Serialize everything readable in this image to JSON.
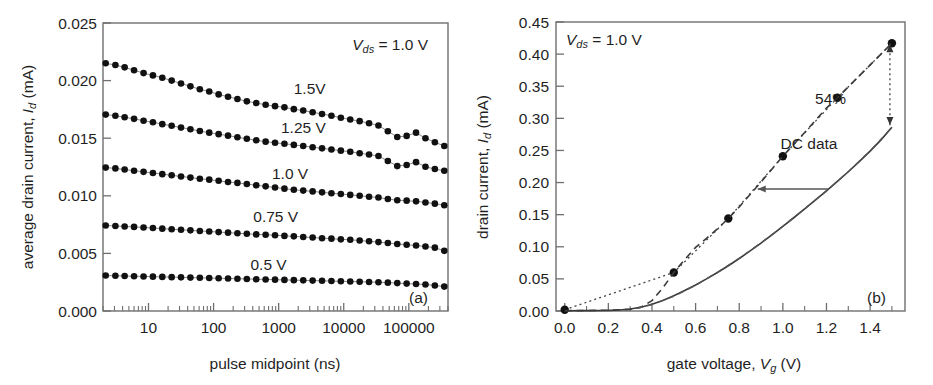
{
  "figure": {
    "panel_a_label": "(a)",
    "panel_b_label": "(b)"
  },
  "chart_data": [
    {
      "panel": "(a)",
      "type": "scatter",
      "title": "",
      "xlabel": "pulse midpoint (ns)",
      "ylabel": "average drain current, I_d (mA)",
      "ylabel_parts": {
        "pre": "average drain current, ",
        "sym": "I",
        "sub": "d",
        "post": " (mA)"
      },
      "xlabel_parts": {
        "text": "pulse midpoint (ns)"
      },
      "xscale": "log",
      "xlim": [
        2,
        400000
      ],
      "ylim": [
        0.0,
        0.025
      ],
      "grid": false,
      "xticks": [
        10,
        100,
        1000,
        10000,
        100000
      ],
      "xticklabels": [
        "10",
        "100",
        "1000",
        "10000",
        "100000"
      ],
      "yticks": [
        0.0,
        0.005,
        0.01,
        0.015,
        0.02,
        0.025
      ],
      "yticklabels": [
        "0.000",
        "0.005",
        "0.010",
        "0.015",
        "0.020",
        "0.025"
      ],
      "annotations": [
        {
          "name": "vds-annotation",
          "pre": "V",
          "sub": "ds",
          "post": " = 1.0 V"
        }
      ],
      "series": [
        {
          "name": "1.5V",
          "label": "1.5V",
          "x": [
            2.2,
            3.1,
            4.3,
            6.0,
            8.4,
            11.7,
            16.3,
            22.7,
            31.6,
            44.1,
            61.5,
            85.8,
            119.6,
            166.8,
            232.6,
            324.4,
            452.4,
            630.9,
            879.9,
            1227,
            1711,
            2386,
            3328,
            4641,
            6473,
            9027,
            12590,
            17560,
            24490,
            34150,
            47630,
            66430,
            92640,
            129200,
            180200,
            251300,
            350500
          ],
          "y": [
            0.0215,
            0.02135,
            0.02115,
            0.0209,
            0.02065,
            0.02045,
            0.02025,
            0.02,
            0.01975,
            0.0195,
            0.01925,
            0.01905,
            0.0188,
            0.0186,
            0.0184,
            0.0182,
            0.01805,
            0.0179,
            0.01778,
            0.01768,
            0.01752,
            0.0174,
            0.01725,
            0.0171,
            0.01695,
            0.01678,
            0.01662,
            0.01648,
            0.0163,
            0.0161,
            0.0156,
            0.0151,
            0.0152,
            0.01548,
            0.015,
            0.01465,
            0.01432
          ]
        },
        {
          "name": "1.25 V",
          "label": "1.25 V",
          "x": [
            2.2,
            3.1,
            4.3,
            6.0,
            8.4,
            11.7,
            16.3,
            22.7,
            31.6,
            44.1,
            61.5,
            85.8,
            119.6,
            166.8,
            232.6,
            324.4,
            452.4,
            630.9,
            879.9,
            1227,
            1711,
            2386,
            3328,
            4641,
            6473,
            9027,
            12590,
            17560,
            24490,
            34150,
            47630,
            66430,
            92640,
            129200,
            180200,
            251300,
            350500
          ],
          "y": [
            0.01705,
            0.01695,
            0.01682,
            0.01668,
            0.01652,
            0.01638,
            0.01622,
            0.01608,
            0.01592,
            0.01578,
            0.01562,
            0.01548,
            0.01535,
            0.01522,
            0.01508,
            0.01495,
            0.01482,
            0.0147,
            0.0146,
            0.01452,
            0.01442,
            0.01432,
            0.01422,
            0.01412,
            0.01402,
            0.01392,
            0.01382,
            0.0137,
            0.01358,
            0.01345,
            0.01302,
            0.01258,
            0.01268,
            0.01292,
            0.01252,
            0.01232,
            0.01218
          ]
        },
        {
          "name": "1.0 V",
          "label": "1.0 V",
          "x": [
            2.2,
            3.1,
            4.3,
            6.0,
            8.4,
            11.7,
            16.3,
            22.7,
            31.6,
            44.1,
            61.5,
            85.8,
            119.6,
            166.8,
            232.6,
            324.4,
            452.4,
            630.9,
            879.9,
            1227,
            1711,
            2386,
            3328,
            4641,
            6473,
            9027,
            12590,
            17560,
            24490,
            34150,
            47630,
            66430,
            92640,
            129200,
            180200,
            251300,
            350500
          ],
          "y": [
            0.01245,
            0.01238,
            0.01228,
            0.01218,
            0.01208,
            0.01198,
            0.01188,
            0.01178,
            0.01168,
            0.01158,
            0.01148,
            0.0114,
            0.0113,
            0.0112,
            0.01112,
            0.01102,
            0.01092,
            0.01082,
            0.01072,
            0.01062,
            0.01052,
            0.01045,
            0.01038,
            0.0103,
            0.01022,
            0.01015,
            0.01008,
            0.01,
            0.00992,
            0.00985,
            0.00972,
            0.00962,
            0.00958,
            0.00952,
            0.00942,
            0.00932,
            0.00918
          ]
        },
        {
          "name": "0.75 V",
          "label": "0.75 V",
          "x": [
            2.2,
            3.1,
            4.3,
            6.0,
            8.4,
            11.7,
            16.3,
            22.7,
            31.6,
            44.1,
            61.5,
            85.8,
            119.6,
            166.8,
            232.6,
            324.4,
            452.4,
            630.9,
            879.9,
            1227,
            1711,
            2386,
            3328,
            4641,
            6473,
            9027,
            12590,
            17560,
            24490,
            34150,
            47630,
            66430,
            92640,
            129200,
            180200,
            251300,
            350500
          ],
          "y": [
            0.00742,
            0.00738,
            0.00734,
            0.0073,
            0.00725,
            0.0072,
            0.00715,
            0.0071,
            0.00705,
            0.007,
            0.00695,
            0.0069,
            0.00685,
            0.0068,
            0.00675,
            0.0067,
            0.00665,
            0.00662,
            0.00658,
            0.00652,
            0.00648,
            0.00642,
            0.00638,
            0.00632,
            0.00628,
            0.00622,
            0.00618,
            0.00612,
            0.00605,
            0.00598,
            0.0059,
            0.00582,
            0.00575,
            0.00568,
            0.0056,
            0.0055,
            0.00522
          ]
        },
        {
          "name": "0.5 V",
          "label": "0.5 V",
          "x": [
            2.2,
            3.1,
            4.3,
            6.0,
            8.4,
            11.7,
            16.3,
            22.7,
            31.6,
            44.1,
            61.5,
            85.8,
            119.6,
            166.8,
            232.6,
            324.4,
            452.4,
            630.9,
            879.9,
            1227,
            1711,
            2386,
            3328,
            4641,
            6473,
            9027,
            12590,
            17560,
            24490,
            34150,
            47630,
            66430,
            92640,
            129200,
            180200,
            251300,
            350500
          ],
          "y": [
            0.00308,
            0.00306,
            0.00304,
            0.00302,
            0.003,
            0.00298,
            0.00296,
            0.00294,
            0.00292,
            0.0029,
            0.00288,
            0.00286,
            0.00284,
            0.00282,
            0.0028,
            0.00278,
            0.00276,
            0.00274,
            0.00272,
            0.0027,
            0.00268,
            0.00266,
            0.00264,
            0.00262,
            0.0026,
            0.00258,
            0.00256,
            0.00254,
            0.00252,
            0.0025,
            0.00246,
            0.00242,
            0.00238,
            0.00234,
            0.0023,
            0.00222,
            0.00212
          ]
        }
      ],
      "series_label_positions": [
        {
          "label": "1.5V",
          "x": 3000,
          "y": 0.0188
        },
        {
          "label": "1.25 V",
          "x": 2400,
          "y": 0.01545
        },
        {
          "label": "1.0 V",
          "x": 1500,
          "y": 0.01145
        },
        {
          "label": "0.75 V",
          "x": 900,
          "y": 0.00775
        },
        {
          "label": "0.5 V",
          "x": 700,
          "y": 0.0036
        }
      ]
    },
    {
      "panel": "(b)",
      "type": "line",
      "title": "",
      "xlabel": "gate voltage, V_g (V)",
      "ylabel": "drain current, I_d (mA)",
      "ylabel_parts": {
        "pre": "drain current, ",
        "sym": "I",
        "sub": "d",
        "post": " (mA)"
      },
      "xlabel_parts": {
        "pre": "gate voltage, ",
        "sym": "V",
        "sub": "g",
        "post": " (V)"
      },
      "xscale": "linear",
      "xlim": [
        -0.04,
        1.56
      ],
      "ylim": [
        0.0,
        0.45
      ],
      "grid": false,
      "xticks": [
        0.0,
        0.2,
        0.4,
        0.6,
        0.8,
        1.0,
        1.2,
        1.4
      ],
      "xticklabels": [
        "0.0",
        "0.2",
        "0.4",
        "0.6",
        "0.8",
        "1.0",
        "1.2",
        "1.4"
      ],
      "yticks": [
        0.0,
        0.05,
        0.1,
        0.15,
        0.2,
        0.25,
        0.3,
        0.35,
        0.4,
        0.45
      ],
      "yticklabels": [
        "0.00",
        "0.05",
        "0.10",
        "0.15",
        "0.20",
        "0.25",
        "0.30",
        "0.35",
        "0.40",
        "0.45"
      ],
      "annotations": [
        {
          "name": "vds-annotation",
          "pre": "V",
          "sub": "ds",
          "post": " = 1.0 V"
        },
        {
          "name": "percent-annotation",
          "text": "54%",
          "x": 1.29,
          "y": 0.322
        },
        {
          "name": "dc-data-annotation",
          "text": "DC data",
          "x": 1.12,
          "y": 0.253
        }
      ],
      "series": [
        {
          "name": "pulsed data points",
          "style": "markers-dotted",
          "x": [
            0.0,
            0.5,
            0.75,
            1.0,
            1.25,
            1.5
          ],
          "y": [
            0.002,
            0.06,
            0.144,
            0.241,
            0.332,
            0.417
          ]
        },
        {
          "name": "pulsed dashed fit",
          "style": "dashed",
          "x": [
            0.0,
            0.1,
            0.2,
            0.3,
            0.35,
            0.4,
            0.45,
            0.5,
            0.55,
            0.6,
            0.65,
            0.7,
            0.75,
            0.8,
            0.9,
            1.0,
            1.1,
            1.2,
            1.25,
            1.35,
            1.45,
            1.5
          ],
          "y": [
            0.0005,
            0.0008,
            0.0012,
            0.0025,
            0.006,
            0.016,
            0.036,
            0.06,
            0.08,
            0.099,
            0.113,
            0.128,
            0.144,
            0.162,
            0.201,
            0.241,
            0.278,
            0.316,
            0.332,
            0.366,
            0.4,
            0.417
          ]
        },
        {
          "name": "DC data solid",
          "style": "solid",
          "x": [
            0.0,
            0.1,
            0.2,
            0.25,
            0.3,
            0.35,
            0.4,
            0.45,
            0.5,
            0.55,
            0.6,
            0.65,
            0.7,
            0.75,
            0.8,
            0.85,
            0.9,
            0.95,
            1.0,
            1.05,
            1.1,
            1.15,
            1.2,
            1.25,
            1.3,
            1.35,
            1.4,
            1.45,
            1.5
          ],
          "y": [
            0.0004,
            0.0006,
            0.001,
            0.0016,
            0.003,
            0.0058,
            0.0105,
            0.0165,
            0.0238,
            0.0318,
            0.0405,
            0.05,
            0.06,
            0.0705,
            0.0818,
            0.0935,
            0.1058,
            0.1185,
            0.1318,
            0.1452,
            0.159,
            0.173,
            0.1872,
            0.2018,
            0.2168,
            0.2325,
            0.249,
            0.2665,
            0.2862
          ]
        },
        {
          "name": "DC data dashed overlay",
          "style": "dashed-overlay",
          "x": [
            0.33,
            0.4,
            0.5,
            0.6,
            0.7,
            0.8,
            0.9,
            1.0,
            1.1,
            1.2,
            1.3,
            1.4,
            1.5
          ],
          "y": [
            0.004,
            0.01,
            0.023,
            0.04,
            0.06,
            0.082,
            0.106,
            0.132,
            0.159,
            0.187,
            0.217,
            0.249,
            0.286
          ]
        }
      ],
      "callouts": [
        {
          "name": "percent-arrow",
          "type": "double-arrow-vertical",
          "x": 1.5,
          "y_top": 0.417,
          "y_bottom": 0.288
        },
        {
          "name": "dc-to-pulsed-arrow",
          "type": "arrow-left",
          "y": 0.19,
          "x_from": 1.21,
          "x_to": 0.885
        }
      ]
    }
  ]
}
